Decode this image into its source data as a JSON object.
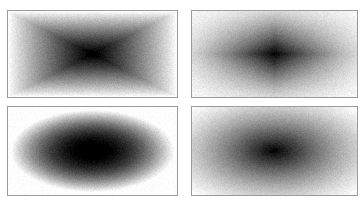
{
  "figure": {
    "layout": "2x2 grid",
    "panels": [
      {
        "id": "top-left",
        "description": "grayscale gradient, dark center with X-shaped falloff toward corners",
        "pattern": "pyramid",
        "box": {
          "x": 7,
          "y": 10,
          "w": 171,
          "h": 88
        }
      },
      {
        "id": "top-right",
        "description": "grayscale gradient, cross-shaped dark band through center",
        "pattern": "cross",
        "box": {
          "x": 191,
          "y": 10,
          "w": 167,
          "h": 88
        }
      },
      {
        "id": "bottom-left",
        "description": "grayscale elliptical gaussian blob on white",
        "pattern": "ellipse",
        "box": {
          "x": 7,
          "y": 106,
          "w": 171,
          "h": 90
        }
      },
      {
        "id": "bottom-right",
        "description": "grayscale soft radial gradient, dark center, gray corners",
        "pattern": "radial",
        "box": {
          "x": 191,
          "y": 106,
          "w": 167,
          "h": 90
        }
      }
    ],
    "colors": {
      "border": "#9a9a9a",
      "background": "#ffffff",
      "dark": "#000000",
      "light": "#ffffff"
    }
  }
}
